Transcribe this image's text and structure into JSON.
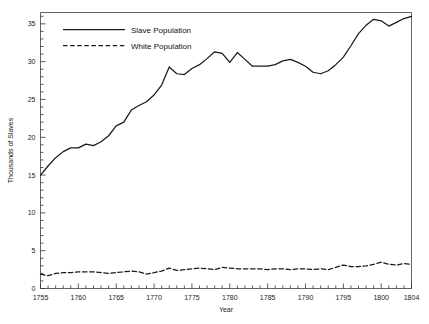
{
  "chart_data": {
    "type": "line",
    "title": "",
    "xlabel": "Year",
    "ylabel": "Thousands of Slaves",
    "xlim": [
      1755,
      1804
    ],
    "ylim": [
      0,
      36.5
    ],
    "grid": false,
    "legend_position": "top-left-inside",
    "x_tick_labels": [
      "1755",
      "1760",
      "1765",
      "1770",
      "1775",
      "1780",
      "1785",
      "1790",
      "1795",
      "1800",
      "1804"
    ],
    "x_major_ticks": [
      1755,
      1760,
      1765,
      1770,
      1775,
      1780,
      1785,
      1790,
      1795,
      1800,
      1804
    ],
    "x_minor_tick_step": 1,
    "y_tick_labels": [
      "0",
      "5",
      "10",
      "15",
      "20",
      "25",
      "30",
      "35"
    ],
    "y_major_ticks": [
      0,
      5,
      10,
      15,
      20,
      25,
      30,
      35
    ],
    "y_minor_tick_step": 1,
    "x": [
      1755,
      1756,
      1757,
      1758,
      1759,
      1760,
      1761,
      1762,
      1763,
      1764,
      1765,
      1766,
      1767,
      1768,
      1769,
      1770,
      1771,
      1772,
      1773,
      1774,
      1775,
      1776,
      1777,
      1778,
      1779,
      1780,
      1781,
      1782,
      1783,
      1784,
      1785,
      1786,
      1787,
      1788,
      1789,
      1790,
      1791,
      1792,
      1793,
      1794,
      1795,
      1796,
      1797,
      1798,
      1799,
      1800,
      1801,
      1802,
      1803,
      1804
    ],
    "series": [
      {
        "name": "Slave Population",
        "style": "solid",
        "color": "#1a1a1a",
        "values": [
          15.0,
          16.2,
          17.3,
          18.1,
          18.6,
          18.6,
          19.1,
          18.9,
          19.4,
          20.2,
          21.5,
          22.0,
          23.6,
          24.2,
          24.7,
          25.6,
          26.9,
          29.3,
          28.4,
          28.3,
          29.1,
          29.6,
          30.4,
          31.3,
          31.1,
          29.9,
          31.2,
          30.3,
          29.4,
          29.4,
          29.4,
          29.6,
          30.1,
          30.3,
          29.9,
          29.4,
          28.6,
          28.4,
          28.8,
          29.6,
          30.6,
          32.1,
          33.7,
          34.8,
          35.6,
          35.4,
          34.7,
          35.2,
          35.7,
          36.0
        ]
      },
      {
        "name": "White Population",
        "style": "dashed",
        "color": "#1a1a1a",
        "values": [
          1.9,
          1.7,
          2.0,
          2.1,
          2.1,
          2.2,
          2.2,
          2.2,
          2.1,
          2.0,
          2.1,
          2.2,
          2.3,
          2.2,
          1.9,
          2.1,
          2.3,
          2.7,
          2.4,
          2.5,
          2.6,
          2.7,
          2.6,
          2.5,
          2.8,
          2.7,
          2.6,
          2.6,
          2.6,
          2.6,
          2.5,
          2.6,
          2.6,
          2.5,
          2.6,
          2.6,
          2.5,
          2.6,
          2.5,
          2.8,
          3.1,
          2.9,
          2.9,
          3.0,
          3.2,
          3.5,
          3.2,
          3.1,
          3.3,
          3.2
        ]
      }
    ]
  },
  "legend": {
    "items": [
      {
        "label": "Slave Population",
        "style": "solid"
      },
      {
        "label": "White Population",
        "style": "dashed"
      }
    ]
  }
}
